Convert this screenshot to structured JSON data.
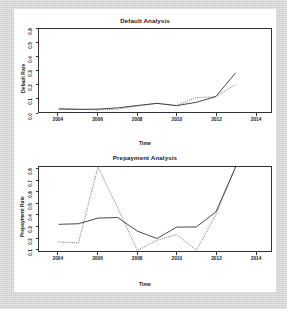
{
  "figure": {
    "background_color": "#d6d6d6",
    "canvas_color": "#ffffff",
    "line_color": "#333333"
  },
  "chart_data": [
    {
      "type": "line",
      "title": "Default Analysis",
      "xlabel": "Time",
      "ylabel": "Default Rate",
      "xlim": [
        2003,
        2014.8
      ],
      "ylim": [
        0.0,
        0.6
      ],
      "xticks": [
        2004,
        2006,
        2008,
        2010,
        2012,
        2014
      ],
      "xticklabels": [
        "2004",
        "2006",
        "2008",
        "2010",
        "2012",
        "2014"
      ],
      "yticks": [
        0.0,
        0.1,
        0.2,
        0.3,
        0.4,
        0.5,
        0.6
      ],
      "yticklabels": [
        "0.0",
        "0.1",
        "0.2",
        "0.3",
        "0.4",
        "0.5",
        "0.6"
      ],
      "grid": false,
      "legend": "none",
      "series": [
        {
          "name": "actual",
          "style": "solid",
          "x": [
            2004,
            2005,
            2006,
            2007,
            2008,
            2009,
            2010,
            2011,
            2012,
            2013
          ],
          "values": [
            0.021,
            0.019,
            0.021,
            0.03,
            0.047,
            0.062,
            0.046,
            0.07,
            0.112,
            0.283
          ]
        },
        {
          "name": "forecast",
          "style": "dotted",
          "x": [
            2004,
            2005,
            2006,
            2007,
            2008,
            2009,
            2010,
            2011,
            2012,
            2013
          ],
          "values": [
            0.027,
            0.021,
            0.014,
            0.02,
            0.043,
            0.064,
            0.046,
            0.105,
            0.11,
            0.2
          ]
        }
      ]
    },
    {
      "type": "line",
      "title": "Prepayment Analysis",
      "xlabel": "Time",
      "ylabel": "Prepayment Rate",
      "xlim": [
        2003,
        2014.8
      ],
      "ylim": [
        0.08,
        0.82
      ],
      "xticks": [
        2004,
        2006,
        2008,
        2010,
        2012,
        2014
      ],
      "xticklabels": [
        "2004",
        "2006",
        "2008",
        "2010",
        "2012",
        "2014"
      ],
      "yticks": [
        0.1,
        0.2,
        0.3,
        0.4,
        0.5,
        0.6,
        0.7,
        0.8
      ],
      "yticklabels": [
        "0.1",
        "0.2",
        "0.3",
        "0.4",
        "0.5",
        "0.6",
        "0.7",
        "0.8"
      ],
      "grid": false,
      "legend": "none",
      "series": [
        {
          "name": "actual",
          "style": "solid",
          "x": [
            2004,
            2005,
            2006,
            2007,
            2008,
            2009,
            2010,
            2011,
            2012,
            2013
          ],
          "values": [
            0.315,
            0.32,
            0.37,
            0.375,
            0.255,
            0.19,
            0.29,
            0.292,
            0.425,
            0.82
          ]
        },
        {
          "name": "forecast",
          "style": "dotted",
          "x": [
            2004,
            2005,
            2006,
            2007,
            2008,
            2009,
            2010,
            2011,
            2012,
            2013
          ],
          "values": [
            0.16,
            0.15,
            0.82,
            0.46,
            0.085,
            0.175,
            0.225,
            0.085,
            0.4,
            0.82
          ]
        }
      ]
    }
  ]
}
